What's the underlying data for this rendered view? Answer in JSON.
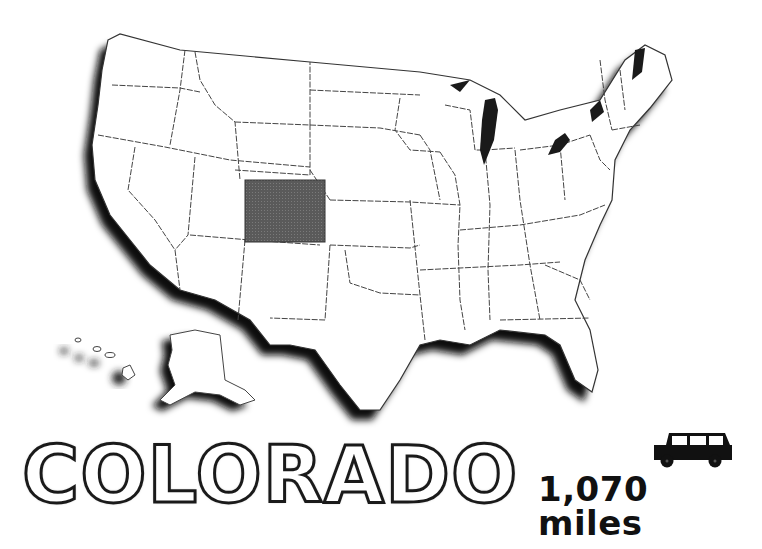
{
  "map": {
    "region": "United States",
    "highlighted_state": "Colorado",
    "highlight_color": "#5a5a5a",
    "outline_color": "#333333",
    "shadow_color": "#111111",
    "inset_states": [
      "Alaska",
      "Hawaii"
    ]
  },
  "title": {
    "text": "COLORADO"
  },
  "distance": {
    "icon": "car-icon",
    "value": "1,070 miles"
  }
}
